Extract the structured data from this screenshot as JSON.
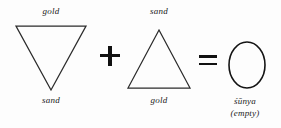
{
  "diagram": {
    "background_color": "#fdfdfd",
    "stroke_color": "#2b2b2b",
    "text_color": "#1a1a1a",
    "terms": [
      {
        "id": "down-triangle",
        "shape": "triangle-down",
        "top_label": "gold",
        "bottom_label": "sand"
      },
      {
        "id": "up-triangle",
        "shape": "triangle-up",
        "top_label": "sand",
        "bottom_label": "gold"
      },
      {
        "id": "circle",
        "shape": "circle",
        "bottom_label_line1": "śūnya",
        "bottom_label_line2": "(empty)"
      }
    ],
    "operators": {
      "plus": "+",
      "equals": "="
    }
  }
}
